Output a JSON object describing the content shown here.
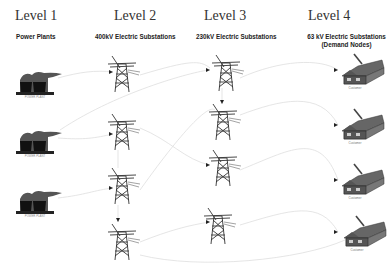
{
  "diagram": {
    "levels": [
      {
        "title": "Level 1",
        "subtitle": "Power Plants"
      },
      {
        "title": "Level 2",
        "subtitle": "400kV Electric Substations"
      },
      {
        "title": "Level 3",
        "subtitle": "230kV Electric Substations"
      },
      {
        "title": "Level 4",
        "subtitle": "63 kV Electric Substations",
        "subtitle2": "(Demand Nodes)"
      }
    ],
    "power_plants": [
      {
        "label": "POWER PLANT"
      },
      {
        "label": "POWER PLANT"
      },
      {
        "label": "POWER PLANT"
      }
    ],
    "substations_400kv_count": 4,
    "substations_230kv_count": 4,
    "demand_nodes": [
      {
        "label": "Customer"
      },
      {
        "label": "Customer"
      },
      {
        "label": "Customer"
      },
      {
        "label": "Customer"
      }
    ],
    "caption": ""
  },
  "colors": {
    "icon": "#2a2a2a",
    "link": "#dcdcdc",
    "text": "#333333"
  }
}
